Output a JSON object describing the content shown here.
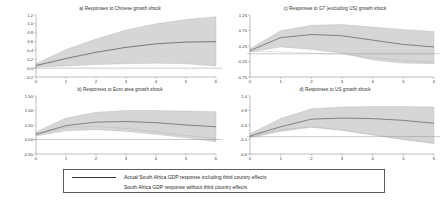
{
  "figure": {
    "background": "#ffffff",
    "line_color": "#333333",
    "band_color": "#bdbdbd",
    "dotted_color": "#8e8e8e"
  },
  "legend": {
    "entries": [
      {
        "style": "solid",
        "label": "Actual South Africa GDP response including third country effects"
      },
      {
        "style": "dotted",
        "label": "South Africa GDP response without third country effects"
      }
    ]
  },
  "chart_data": [
    {
      "type": "line",
      "panel": "a",
      "title": "a) Responses to Chinese growth shock",
      "xlabel": "",
      "ylabel": "",
      "x": [
        0,
        1,
        2,
        3,
        4,
        5,
        6
      ],
      "xlim": [
        0,
        6
      ],
      "ylim": [
        -0.2,
        1.2
      ],
      "xticks": [
        "0",
        "1",
        "2",
        "3",
        "4",
        "5",
        "6"
      ],
      "yticks": [
        "1.2",
        "1.0",
        "0.8",
        "0.6",
        "0.4",
        "0.2",
        "0.0",
        "-0.2"
      ],
      "ytick_values": [
        1.2,
        1.0,
        0.8,
        0.6,
        0.4,
        0.2,
        0.0,
        -0.2
      ],
      "grid": false,
      "zero_line": true,
      "series": [
        {
          "name": "Actual South Africa GDP response including third country effects",
          "style": "solid",
          "values": [
            0.06,
            0.22,
            0.36,
            0.47,
            0.55,
            0.59,
            0.6
          ]
        },
        {
          "name": "South Africa GDP response without third country effects",
          "style": "dotted",
          "values": [
            0.05,
            0.2,
            0.34,
            0.46,
            0.54,
            0.58,
            0.59
          ]
        },
        {
          "name": "upper confidence band",
          "style": "band-upper",
          "values": [
            0.1,
            0.42,
            0.66,
            0.86,
            1.0,
            1.1,
            1.16
          ]
        },
        {
          "name": "lower confidence band",
          "style": "band-lower",
          "values": [
            0.02,
            0.05,
            0.08,
            0.1,
            0.11,
            0.1,
            0.05
          ]
        }
      ]
    },
    {
      "type": "line",
      "panel": "b",
      "title": "b) Responses to Euro area growth shock",
      "xlabel": "",
      "ylabel": "",
      "x": [
        0,
        1,
        2,
        3,
        4,
        5,
        6
      ],
      "xlim": [
        0,
        6
      ],
      "ylim": [
        -0.5,
        1.5
      ],
      "xticks": [
        "0",
        "1",
        "2",
        "3",
        "4",
        "5",
        "6"
      ],
      "yticks": [
        "1.50",
        "1.00",
        "0.50",
        "0.00",
        "-0.50"
      ],
      "ytick_values": [
        1.5,
        1.0,
        0.5,
        0.0,
        -0.5
      ],
      "grid": false,
      "zero_line": true,
      "series": [
        {
          "name": "Actual South Africa GDP response including third country effects",
          "style": "solid",
          "values": [
            0.18,
            0.48,
            0.6,
            0.62,
            0.58,
            0.5,
            0.44
          ]
        },
        {
          "name": "South Africa GDP response without third country effects",
          "style": "dotted",
          "values": [
            0.16,
            0.42,
            0.46,
            0.38,
            0.26,
            0.14,
            0.04
          ]
        },
        {
          "name": "upper confidence band",
          "style": "band-upper",
          "values": [
            0.26,
            0.74,
            0.94,
            1.0,
            1.0,
            0.98,
            0.96
          ]
        },
        {
          "name": "lower confidence band",
          "style": "band-lower",
          "values": [
            0.12,
            0.3,
            0.34,
            0.28,
            0.18,
            0.06,
            -0.08
          ]
        }
      ]
    },
    {
      "type": "line",
      "panel": "c",
      "title": "c) Responses to G7 (excluding US) growth shock",
      "xlabel": "",
      "ylabel": "",
      "x": [
        0,
        1,
        2,
        3,
        4,
        5,
        6
      ],
      "xlim": [
        0,
        6
      ],
      "ylim": [
        -0.75,
        1.25
      ],
      "xticks": [
        "0",
        "1",
        "2",
        "3",
        "4",
        "5",
        "6"
      ],
      "yticks": [
        "1.25",
        "0.75",
        "0.25",
        "-0.25",
        "-0.75"
      ],
      "ytick_values": [
        1.25,
        0.75,
        0.25,
        -0.25,
        -0.75
      ],
      "grid": false,
      "zero_line": true,
      "series": [
        {
          "name": "Actual South Africa GDP response including third country effects",
          "style": "solid",
          "values": [
            0.1,
            0.52,
            0.62,
            0.58,
            0.44,
            0.3,
            0.22
          ]
        },
        {
          "name": "South Africa GDP response without third country effects",
          "style": "dotted",
          "values": [
            0.08,
            0.06,
            0.02,
            -0.02,
            -0.12,
            -0.22,
            -0.28
          ]
        },
        {
          "name": "upper confidence band",
          "style": "band-upper",
          "values": [
            0.16,
            0.74,
            0.92,
            0.94,
            0.86,
            0.78,
            0.72
          ]
        },
        {
          "name": "lower confidence band",
          "style": "band-lower",
          "values": [
            0.06,
            0.22,
            0.14,
            0.02,
            -0.2,
            -0.3,
            -0.32
          ]
        }
      ]
    },
    {
      "type": "line",
      "panel": "d",
      "title": "d) Responses to US growth shock",
      "xlabel": "",
      "ylabel": "",
      "x": [
        0,
        1,
        2,
        3,
        4,
        5,
        6
      ],
      "xlim": [
        -0.6,
        1.4
      ],
      "ylim": [
        -0.6,
        1.4
      ],
      "xticks": [
        "0",
        "1",
        "2",
        "3",
        "4",
        "5",
        "6"
      ],
      "yticks": [
        "1.4",
        "0.9",
        "0.4",
        "-0.1",
        "-0.6"
      ],
      "ytick_values": [
        1.4,
        0.9,
        0.4,
        -0.1,
        -0.6
      ],
      "grid": false,
      "zero_line": true,
      "series": [
        {
          "name": "Actual South Africa GDP response including third country effects",
          "style": "solid",
          "values": [
            0.02,
            0.34,
            0.6,
            0.64,
            0.62,
            0.56,
            0.46
          ]
        },
        {
          "name": "South Africa GDP response without third country effects",
          "style": "dotted",
          "values": [
            0.0,
            0.24,
            0.34,
            0.22,
            0.06,
            -0.1,
            -0.22
          ]
        },
        {
          "name": "upper confidence band",
          "style": "band-upper",
          "values": [
            0.1,
            0.62,
            0.96,
            1.02,
            1.04,
            1.04,
            1.02
          ]
        },
        {
          "name": "lower confidence band",
          "style": "band-lower",
          "values": [
            -0.04,
            0.18,
            0.32,
            0.22,
            0.06,
            -0.1,
            -0.24
          ]
        }
      ]
    }
  ]
}
